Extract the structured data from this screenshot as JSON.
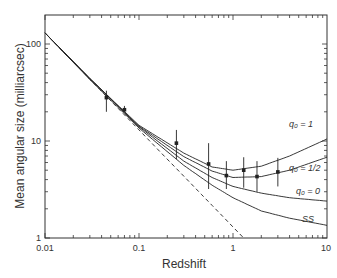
{
  "chart_data": {
    "type": "scatter",
    "title": "",
    "xlabel": "Redshift",
    "ylabel": "Mean angular size (milliarcsec)",
    "xscale": "log",
    "yscale": "log",
    "xlim": [
      0.01,
      10
    ],
    "ylim": [
      1,
      150
    ],
    "x_ticks": [
      "0.01",
      "0.1",
      "1",
      "10"
    ],
    "y_ticks": [
      "1",
      "10",
      "100"
    ],
    "grid": false,
    "points": [
      {
        "x": 0.045,
        "y": 28,
        "ylo": 20,
        "yhi": 33
      },
      {
        "x": 0.07,
        "y": 21,
        "ylo": 20,
        "yhi": 23
      },
      {
        "x": 0.25,
        "y": 9.5,
        "ylo": 6.5,
        "yhi": 13
      },
      {
        "x": 0.55,
        "y": 5.8,
        "ylo": 3.2,
        "yhi": 9.5
      },
      {
        "x": 0.85,
        "y": 4.4,
        "ylo": 3.2,
        "yhi": 6.2
      },
      {
        "x": 1.3,
        "y": 5.0,
        "ylo": 3.3,
        "yhi": 6.8
      },
      {
        "x": 1.8,
        "y": 4.3,
        "ylo": 3.0,
        "yhi": 6.2
      },
      {
        "x": 3.0,
        "y": 4.8,
        "ylo": 3.4,
        "yhi": 6.7
      }
    ],
    "series": [
      {
        "name": "q0 = 1",
        "label": "q₀ = 1",
        "style": "solid",
        "x": [
          0.01,
          0.03,
          0.1,
          0.3,
          0.6,
          1,
          2,
          4,
          10
        ],
        "y": [
          130,
          44,
          14.5,
          7.5,
          5.4,
          5.0,
          5.5,
          7.0,
          10.5
        ]
      },
      {
        "name": "q0 = 1/2",
        "label": "q₀ = 1/2",
        "style": "solid",
        "x": [
          0.01,
          0.03,
          0.1,
          0.3,
          0.6,
          1,
          2,
          4,
          10
        ],
        "y": [
          130,
          44,
          14.2,
          6.9,
          4.9,
          4.2,
          4.3,
          5.0,
          6.8
        ]
      },
      {
        "name": "q0 = 0",
        "label": "q₀ = 0",
        "style": "solid",
        "x": [
          0.01,
          0.03,
          0.1,
          0.3,
          0.6,
          1,
          2,
          4,
          10
        ],
        "y": [
          130,
          44,
          14.0,
          6.2,
          4.2,
          3.4,
          2.9,
          2.6,
          2.4
        ]
      },
      {
        "name": "SS",
        "label": "SS",
        "style": "solid",
        "x": [
          0.01,
          0.03,
          0.1,
          0.3,
          0.6,
          1,
          2,
          4,
          10
        ],
        "y": [
          130,
          43,
          13.6,
          5.6,
          3.5,
          2.6,
          1.9,
          1.6,
          1.35
        ]
      },
      {
        "name": "Euclidean",
        "label": "",
        "style": "dashed",
        "x": [
          0.01,
          0.1,
          1.3
        ],
        "y": [
          130,
          13,
          1.0
        ]
      }
    ]
  },
  "labels": {
    "x_axis_title": "Redshift",
    "y_axis_title": "Mean angular size (milliarcsec)",
    "x_ticks": [
      "0.01",
      "0.1",
      "1",
      "10"
    ],
    "y_ticks": [
      "1",
      "10",
      "100"
    ],
    "curve_q1": "q₀ = 1",
    "curve_qhalf": "q₀ = 1/2",
    "curve_q0": "q₀ = 0",
    "curve_ss": "SS"
  }
}
